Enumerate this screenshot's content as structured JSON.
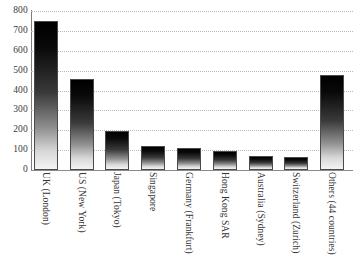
{
  "chart_data": {
    "type": "bar",
    "title": "",
    "subtitle": "",
    "xlabel": "",
    "ylabel": "",
    "ylim": [
      0,
      800
    ],
    "ytick_step": 100,
    "yticks": [
      0,
      100,
      200,
      300,
      400,
      500,
      600,
      700,
      800
    ],
    "ytick_labels": [
      "0",
      "100",
      "200",
      "300",
      "400",
      "500",
      "600",
      "700",
      "800"
    ],
    "grid": true,
    "grid_style": "dotted-horizontal",
    "legend": false,
    "legend_position": "none",
    "bar_fill": "vertical-gradient-black-to-white",
    "bar_outline_color": "#4a4a4a",
    "categories": [
      "UK (London)",
      "US (New York)",
      "Japan (Tokyo)",
      "Singapore",
      "Germany (Frankfurt)",
      "Hong Kong SAR",
      "Australia (Sydney)",
      "Switzerland (Zurich)",
      "Others (44 countries)"
    ],
    "values": [
      752,
      456,
      196,
      119,
      112,
      97,
      71,
      68,
      478
    ]
  },
  "axes": {
    "y_axis_name": "y-axis",
    "x_axis_name": "x-axis"
  }
}
